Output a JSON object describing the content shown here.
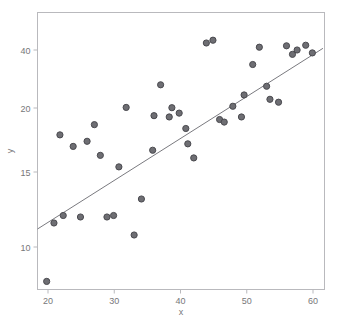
{
  "chart_data": {
    "type": "scatter",
    "title": "",
    "subtitle": "",
    "xlabel": "x",
    "ylabel": "y",
    "xlim": [
      17.5,
      61.5
    ],
    "ylim": [
      7.0,
      45.0
    ],
    "xticks": [
      20,
      30,
      40,
      50,
      60
    ],
    "xticklabels": [
      "20",
      "30",
      "40",
      "50",
      "60"
    ],
    "yticks": [
      10,
      15,
      20,
      40
    ],
    "yticklabels": [
      "10",
      "15",
      "20",
      "40"
    ],
    "yscale": "nonlinear-compressed",
    "grid": false,
    "legend": null,
    "point_color": "#6e6e73",
    "point_edge_color": "#4a4a4f",
    "line_color": "#7a7a7f",
    "frame_color": "#b9b9bd",
    "points": [
      {
        "x": 19.8,
        "y": 7.6
      },
      {
        "x": 20.9,
        "y": 11.6
      },
      {
        "x": 21.8,
        "y": 17.9
      },
      {
        "x": 22.3,
        "y": 12.1
      },
      {
        "x": 23.8,
        "y": 17.0
      },
      {
        "x": 24.9,
        "y": 12.0
      },
      {
        "x": 25.9,
        "y": 17.4
      },
      {
        "x": 27.0,
        "y": 18.7
      },
      {
        "x": 27.9,
        "y": 16.3
      },
      {
        "x": 28.9,
        "y": 12.0
      },
      {
        "x": 29.9,
        "y": 12.1
      },
      {
        "x": 30.7,
        "y": 15.4
      },
      {
        "x": 31.8,
        "y": 20.2
      },
      {
        "x": 33.0,
        "y": 10.8
      },
      {
        "x": 34.1,
        "y": 13.2
      },
      {
        "x": 35.8,
        "y": 16.7
      },
      {
        "x": 36.0,
        "y": 19.4
      },
      {
        "x": 37.0,
        "y": 28.0
      },
      {
        "x": 38.3,
        "y": 19.3
      },
      {
        "x": 38.7,
        "y": 20.1
      },
      {
        "x": 39.8,
        "y": 19.6
      },
      {
        "x": 40.8,
        "y": 18.4
      },
      {
        "x": 41.1,
        "y": 17.2
      },
      {
        "x": 42.0,
        "y": 16.1
      },
      {
        "x": 43.9,
        "y": 42.5
      },
      {
        "x": 44.9,
        "y": 43.5
      },
      {
        "x": 45.9,
        "y": 19.1
      },
      {
        "x": 46.6,
        "y": 18.9
      },
      {
        "x": 47.9,
        "y": 20.6
      },
      {
        "x": 49.2,
        "y": 19.3
      },
      {
        "x": 49.6,
        "y": 24.5
      },
      {
        "x": 50.9,
        "y": 35.0
      },
      {
        "x": 51.9,
        "y": 41.0
      },
      {
        "x": 53.0,
        "y": 27.5
      },
      {
        "x": 53.5,
        "y": 23.0
      },
      {
        "x": 54.8,
        "y": 22.0
      },
      {
        "x": 56.0,
        "y": 41.5
      },
      {
        "x": 56.9,
        "y": 38.5
      },
      {
        "x": 57.6,
        "y": 40.0
      },
      {
        "x": 58.9,
        "y": 41.7
      },
      {
        "x": 59.9,
        "y": 39.0
      }
    ],
    "fit_line": {
      "label": "regression-line",
      "x_start": 17.5,
      "y_start": 11.2,
      "x_end": 61.5,
      "y_end": 40.6
    }
  }
}
